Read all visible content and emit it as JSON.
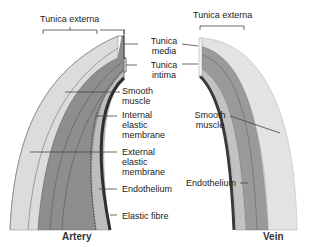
{
  "artery": {
    "caption": "Artery",
    "labels": {
      "tunica_externa": "Tunica externa",
      "tunica_media_1": "Tunica",
      "tunica_media_2": "media",
      "tunica_intima_1": "Tunica",
      "tunica_intima_2": "intima",
      "smooth_muscle_1": "Smooth",
      "smooth_muscle_2": "muscle",
      "internal_elastic_1": "Internal",
      "internal_elastic_2": "elastic",
      "internal_elastic_3": "membrane",
      "external_elastic_1": "External",
      "external_elastic_2": "elastic",
      "external_elastic_3": "membrane",
      "endothelium": "Endothelium",
      "elastic_fibre": "Elastic fibre"
    }
  },
  "vein": {
    "caption": "Vein",
    "labels": {
      "tunica_externa": "Tunica externa",
      "smooth_muscle_1": "Smooth",
      "smooth_muscle_2": "muscle",
      "endothelium": "Endothelium"
    }
  },
  "colors": {
    "externa": "#d9d9d9",
    "media": "#8a8a8a",
    "intima": "#bdbdbd",
    "endothelium": "#3a3a3a",
    "leader_line": "#444444"
  }
}
